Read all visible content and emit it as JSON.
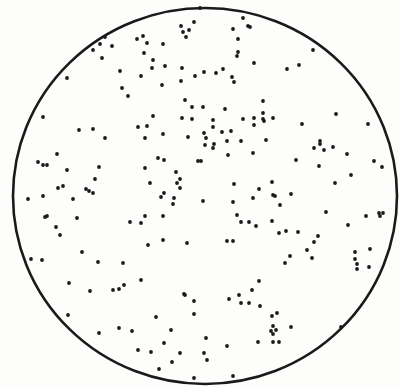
{
  "figure": {
    "background_color": "#fdfdfc",
    "ink_color": "#1a1a1a",
    "plate": {
      "cx": 205,
      "cy": 196,
      "rx": 192,
      "ry": 188,
      "stroke_width": 2.6
    },
    "dot_radius": 1.9,
    "dots": [
      [
        194,
        22
      ],
      [
        181,
        26
      ],
      [
        183,
        32
      ],
      [
        189,
        30
      ],
      [
        186,
        37
      ],
      [
        143,
        36
      ],
      [
        137,
        39
      ],
      [
        147,
        43
      ],
      [
        163,
        44
      ],
      [
        105,
        37
      ],
      [
        100,
        44
      ],
      [
        112,
        46
      ],
      [
        93,
        50
      ],
      [
        144,
        53
      ],
      [
        102,
        58
      ],
      [
        153,
        60
      ],
      [
        152,
        68
      ],
      [
        165,
        66
      ],
      [
        182,
        68
      ],
      [
        120,
        71
      ],
      [
        141,
        76
      ],
      [
        181,
        81
      ],
      [
        195,
        76
      ],
      [
        67,
        78
      ],
      [
        162,
        85
      ],
      [
        122,
        88
      ],
      [
        128,
        96
      ],
      [
        185,
        100
      ],
      [
        192,
        107
      ],
      [
        243,
        18
      ],
      [
        248,
        26
      ],
      [
        250,
        27
      ],
      [
        233,
        29
      ],
      [
        238,
        39
      ],
      [
        238,
        52
      ],
      [
        237,
        56
      ],
      [
        254,
        63
      ],
      [
        204,
        72
      ],
      [
        216,
        73
      ],
      [
        223,
        69
      ],
      [
        232,
        77
      ],
      [
        234,
        82
      ],
      [
        287,
        69
      ],
      [
        299,
        65
      ],
      [
        313,
        50
      ],
      [
        263,
        101
      ],
      [
        225,
        109
      ],
      [
        203,
        107
      ],
      [
        43,
        117
      ],
      [
        79,
        130
      ],
      [
        93,
        129
      ],
      [
        105,
        138
      ],
      [
        153,
        116
      ],
      [
        138,
        127
      ],
      [
        147,
        126
      ],
      [
        145,
        138
      ],
      [
        163,
        134
      ],
      [
        182,
        118
      ],
      [
        192,
        119
      ],
      [
        188,
        137
      ],
      [
        57,
        154
      ],
      [
        38,
        162
      ],
      [
        43,
        165
      ],
      [
        47,
        165
      ],
      [
        67,
        170
      ],
      [
        99,
        167
      ],
      [
        95,
        179
      ],
      [
        58,
        188
      ],
      [
        63,
        186
      ],
      [
        86,
        189
      ],
      [
        89,
        191
      ],
      [
        93,
        193
      ],
      [
        145,
        168
      ],
      [
        158,
        158
      ],
      [
        164,
        160
      ],
      [
        198,
        161
      ],
      [
        176,
        172
      ],
      [
        180,
        179
      ],
      [
        177,
        183
      ],
      [
        180,
        188
      ],
      [
        150,
        183
      ],
      [
        164,
        193
      ],
      [
        161,
        197
      ],
      [
        174,
        198
      ],
      [
        43,
        196
      ],
      [
        28,
        199
      ],
      [
        73,
        199
      ],
      [
        213,
        120
      ],
      [
        213,
        127
      ],
      [
        204,
        133
      ],
      [
        206,
        138
      ],
      [
        222,
        132
      ],
      [
        231,
        131
      ],
      [
        243,
        119
      ],
      [
        254,
        118
      ],
      [
        254,
        125
      ],
      [
        263,
        113
      ],
      [
        263,
        119
      ],
      [
        264,
        121
      ],
      [
        273,
        118
      ],
      [
        205,
        145
      ],
      [
        214,
        144
      ],
      [
        213,
        148
      ],
      [
        227,
        141
      ],
      [
        241,
        141
      ],
      [
        266,
        140
      ],
      [
        228,
        155
      ],
      [
        253,
        153
      ],
      [
        201,
        161
      ],
      [
        302,
        124
      ],
      [
        336,
        114
      ],
      [
        368,
        124
      ],
      [
        320,
        141
      ],
      [
        320,
        144
      ],
      [
        314,
        148
      ],
      [
        324,
        150
      ],
      [
        333,
        147
      ],
      [
        347,
        154
      ],
      [
        296,
        160
      ],
      [
        319,
        166
      ],
      [
        374,
        161
      ],
      [
        382,
        167
      ],
      [
        351,
        175
      ],
      [
        335,
        183
      ],
      [
        234,
        184
      ],
      [
        272,
        182
      ],
      [
        259,
        189
      ],
      [
        253,
        198
      ],
      [
        273,
        195
      ],
      [
        275,
        196
      ],
      [
        291,
        194
      ],
      [
        45,
        217
      ],
      [
        47,
        216
      ],
      [
        56,
        227
      ],
      [
        60,
        235
      ],
      [
        77,
        218
      ],
      [
        31,
        259
      ],
      [
        42,
        260
      ],
      [
        82,
        252
      ],
      [
        98,
        262
      ],
      [
        69,
        283
      ],
      [
        123,
        263
      ],
      [
        141,
        280
      ],
      [
        130,
        222
      ],
      [
        141,
        223
      ],
      [
        145,
        216
      ],
      [
        163,
        216
      ],
      [
        148,
        245
      ],
      [
        163,
        240
      ],
      [
        187,
        243
      ],
      [
        173,
        204
      ],
      [
        184,
        294
      ],
      [
        203,
        201
      ],
      [
        233,
        202
      ],
      [
        280,
        205
      ],
      [
        237,
        215
      ],
      [
        241,
        222
      ],
      [
        249,
        222
      ],
      [
        256,
        226
      ],
      [
        272,
        221
      ],
      [
        279,
        233
      ],
      [
        286,
        231
      ],
      [
        298,
        232
      ],
      [
        227,
        241
      ],
      [
        233,
        241
      ],
      [
        314,
        242
      ],
      [
        318,
        236
      ],
      [
        307,
        250
      ],
      [
        312,
        258
      ],
      [
        290,
        256
      ],
      [
        285,
        263
      ],
      [
        326,
        212
      ],
      [
        348,
        225
      ],
      [
        366,
        216
      ],
      [
        379,
        213
      ],
      [
        380,
        216
      ],
      [
        383,
        213
      ],
      [
        355,
        252
      ],
      [
        355,
        259
      ],
      [
        357,
        264
      ],
      [
        357,
        269
      ],
      [
        370,
        249
      ],
      [
        369,
        267
      ],
      [
        259,
        281
      ],
      [
        239,
        295
      ],
      [
        90,
        291
      ],
      [
        113,
        290
      ],
      [
        119,
        289
      ],
      [
        124,
        285
      ],
      [
        68,
        315
      ],
      [
        99,
        333
      ],
      [
        119,
        328
      ],
      [
        132,
        331
      ],
      [
        156,
        317
      ],
      [
        171,
        330
      ],
      [
        164,
        343
      ],
      [
        138,
        350
      ],
      [
        151,
        352
      ],
      [
        180,
        353
      ],
      [
        172,
        362
      ],
      [
        159,
        369
      ],
      [
        185,
        295
      ],
      [
        194,
        301
      ],
      [
        194,
        314
      ],
      [
        194,
        378
      ],
      [
        252,
        290
      ],
      [
        229,
        299
      ],
      [
        241,
        303
      ],
      [
        249,
        303
      ],
      [
        260,
        306
      ],
      [
        277,
        313
      ],
      [
        272,
        316
      ],
      [
        273,
        326
      ],
      [
        276,
        330
      ],
      [
        271,
        331
      ],
      [
        273,
        334
      ],
      [
        291,
        327
      ],
      [
        258,
        342
      ],
      [
        273,
        342
      ],
      [
        279,
        342
      ],
      [
        227,
        346
      ],
      [
        206,
        338
      ],
      [
        204,
        353
      ],
      [
        207,
        360
      ],
      [
        233,
        376
      ],
      [
        341,
        327
      ],
      [
        200,
        8
      ]
    ]
  }
}
